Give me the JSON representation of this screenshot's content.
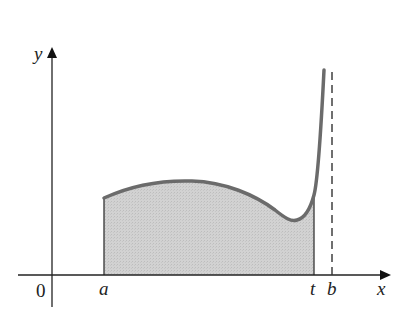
{
  "diagram": {
    "axes": {
      "x_label": "x",
      "y_label": "y",
      "origin_label": "0"
    },
    "points": {
      "a_label": "a",
      "t_label": "t",
      "b_label": "b"
    },
    "colors": {
      "curve": "#6b6b6b",
      "fill": "#cfcfcf",
      "axis": "#222222",
      "asymptote": "#222222"
    },
    "elements": {
      "curve": "y = f(x), rising sharply toward vertical asymptote at x = b",
      "shaded_region": "area under f from a to t",
      "asymptote": "dashed vertical line at x = b"
    }
  }
}
